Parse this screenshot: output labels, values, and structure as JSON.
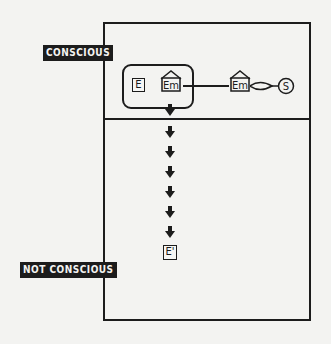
{
  "diagram": {
    "labels": {
      "conscious": "CONSCIOUS",
      "not_conscious": "NOT CONSCIOUS"
    },
    "nodes": {
      "e": "E",
      "em_inner": "Em",
      "em_outer": "Em",
      "s": "S",
      "e_prime": "E'"
    },
    "arrow_count": 7,
    "colors": {
      "ink": "#1c1c1c",
      "paper": "#f3f3f1"
    }
  }
}
